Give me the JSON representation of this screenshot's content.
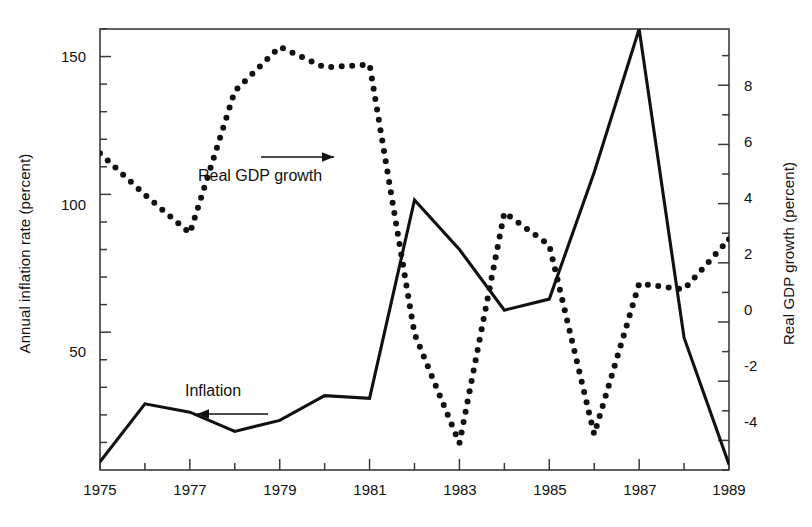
{
  "chart_data": {
    "type": "line",
    "title": "",
    "subtitle": "",
    "xlabel": "",
    "grid": false,
    "legend_position": "inline-annotations",
    "x": [
      1975,
      1976,
      1977,
      1978,
      1979,
      1980,
      1981,
      1982,
      1983,
      1984,
      1985,
      1986,
      1987,
      1988,
      1989
    ],
    "xlim": [
      1975,
      1989
    ],
    "xticks_major": [
      1975,
      1977,
      1979,
      1981,
      1983,
      1985,
      1987,
      1989
    ],
    "xticks_minor": [
      1976,
      1978,
      1980,
      1982,
      1984,
      1986,
      1988
    ],
    "xtick_labels": [
      "1975",
      "1977",
      "1979",
      "1981",
      "1983",
      "1985",
      "1987",
      "1989"
    ],
    "left_axis": {
      "label": "Annual inflation rate (percent)",
      "ylim": [
        0,
        160
      ],
      "ticks_major": [
        50,
        100,
        150
      ],
      "tick_labels": [
        "50",
        "100",
        "150"
      ],
      "ticks_minor": [
        10,
        20,
        30,
        40,
        60,
        70,
        80,
        90,
        110,
        120,
        130,
        140,
        160
      ]
    },
    "right_axis": {
      "label": "Real GDP growth (percent)",
      "ylim": [
        -5.0,
        9.9
      ],
      "ticks_major": [
        -4,
        -2,
        0,
        2,
        4,
        6,
        8
      ],
      "tick_labels": [
        "-4",
        "-2",
        "0",
        "2",
        "4",
        "6",
        "8"
      ],
      "ticks_minor": [
        -5,
        -3,
        -1,
        1,
        3,
        5,
        7,
        9
      ]
    },
    "series": [
      {
        "name": "Inflation",
        "axis": "left",
        "style": "solid",
        "color": "#111111",
        "values": [
          3,
          24,
          21,
          14,
          18,
          27,
          26,
          98,
          80,
          58,
          62,
          108,
          160,
          48,
          2
        ]
      },
      {
        "name": "Real GDP growth",
        "axis": "right",
        "style": "dotted",
        "color": "#111111",
        "values": [
          5.7,
          4.3,
          3.0,
          7.8,
          9.3,
          8.6,
          8.7,
          -0.4,
          -4.1,
          3.7,
          2.6,
          -3.8,
          1.3,
          1.1,
          2.8
        ]
      }
    ],
    "annotations": [
      {
        "id": "gdp",
        "text": "Real GDP growth",
        "arrow": "right",
        "points_to": "right-axis"
      },
      {
        "id": "inflation",
        "text": "Inflation",
        "arrow": "left",
        "points_to": "left-axis"
      }
    ]
  },
  "axes": {
    "left_title": "Annual inflation rate (percent)",
    "right_title": "Real GDP growth (percent)"
  },
  "ticks": {
    "left": [
      "150",
      "100",
      "50"
    ],
    "right": [
      "8",
      "6",
      "4",
      "2",
      "0",
      "-2",
      "-4"
    ],
    "x": [
      "1975",
      "1977",
      "1979",
      "1981",
      "1983",
      "1985",
      "1987",
      "1989"
    ]
  },
  "annotations": {
    "gdp_label": "Real GDP growth",
    "inflation_label": "Inflation"
  },
  "colors": {
    "ink": "#111111",
    "frame": "#3a3a3a",
    "background": "#ffffff"
  }
}
